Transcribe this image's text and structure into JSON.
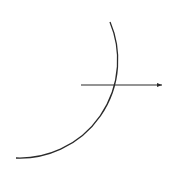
{
  "diagram": {
    "background": "#ffffff",
    "stroke_color": "#2a2a2a",
    "arc": {
      "start": [
        110,
        22
      ],
      "end": [
        16,
        158
      ],
      "radius": 98,
      "stroke_width": 1.3
    },
    "arrow": {
      "start": [
        81,
        85
      ],
      "end": [
        162,
        85
      ],
      "stroke_width": 1.2,
      "head": "small-triangle"
    }
  }
}
